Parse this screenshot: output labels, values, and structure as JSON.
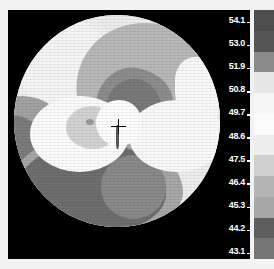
{
  "display": {
    "title": "Corneal Topography Map",
    "background_color": "#000000",
    "panel_border_color": "#ffffff"
  },
  "map": {
    "name": "axial-curvature-map",
    "shape": "circle",
    "center_marker": "crosshair",
    "center_marker_label": "+",
    "units": "D"
  },
  "scale": {
    "name": "diopter-color-scale",
    "orientation": "vertical",
    "label_color": "#ffffff",
    "step": 1.1,
    "max": 54.1,
    "min": 43.1,
    "labels": [
      "54.1",
      "53.0",
      "51.9",
      "50.8",
      "49.7",
      "48.6",
      "47.5",
      "46.4",
      "45.3",
      "44.2",
      "43.1"
    ],
    "tick_glyph": "_",
    "swatches": [
      "#4e4e4e",
      "#565656",
      "#8b8b8b",
      "#e7e7e7",
      "#f7f7f7",
      "#fbfbfb",
      "#ededed",
      "#cfcfcf",
      "#b4b4b4",
      "#a7a7a7",
      "#5e5e5e",
      "#767676"
    ]
  },
  "chart_data": {
    "type": "heatmap",
    "xlabel": "",
    "ylabel": "",
    "colorbar_label": "Diopters",
    "colorbar_ticks": [
      54.1,
      53.0,
      51.9,
      50.8,
      49.7,
      48.6,
      47.5,
      46.4,
      45.3,
      44.2,
      43.1
    ],
    "colorbar_step": 1.1,
    "zlim": [
      43.1,
      54.1
    ],
    "colormap": "grayscale",
    "grid": false,
    "legend_position": "right",
    "annotations": [
      {
        "name": "center-crosshair",
        "symbol": "+",
        "x": 0,
        "y": 0
      }
    ],
    "regions": [
      {
        "name": "outer-bright-ring",
        "approx_value": 47.5,
        "shade": "#efefef"
      },
      {
        "name": "upper-right-mid-gray",
        "approx_value": 51.9,
        "shade": "#b9b9b9"
      },
      {
        "name": "upper-center-dark-core",
        "approx_value": 53.5,
        "shade": "#7a7a7a"
      },
      {
        "name": "lower-left-dark-mass",
        "approx_value": 53.0,
        "shade": "#6f6f6f"
      },
      {
        "name": "central-bright-bowtie",
        "approx_value": 44.2,
        "shade": "#ffffff"
      },
      {
        "name": "left-mid-gray-band",
        "approx_value": 50.8,
        "shade": "#a3a3a3"
      }
    ]
  }
}
